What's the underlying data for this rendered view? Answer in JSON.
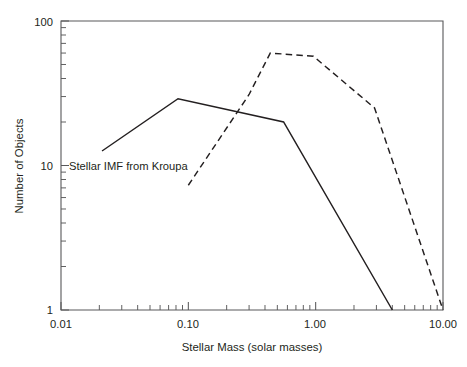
{
  "chart_data": {
    "type": "line",
    "title": "",
    "xlabel": "Stellar Mass (solar masses)",
    "ylabel": "Number of Objects",
    "xscale": "log",
    "yscale": "log",
    "xlim": [
      0.01,
      10.0
    ],
    "ylim": [
      1,
      100
    ],
    "grid": false,
    "legend_position": "none",
    "xticks": [
      0.01,
      0.1,
      1.0,
      10.0
    ],
    "xtick_labels": [
      "0.01",
      "0.10",
      "1.00",
      "10.00"
    ],
    "yticks": [
      1,
      10,
      100
    ],
    "ytick_labels": [
      "1",
      "10",
      "100"
    ],
    "annotations": [
      {
        "text": "Stellar IMF from Kroupa",
        "x": 0.0115,
        "y": 10.2,
        "anchor": "start",
        "target_series": "Stellar IMF from Kroupa"
      }
    ],
    "series": [
      {
        "name": "Stellar IMF from Kroupa",
        "style": "solid",
        "color": "#231f20",
        "x": [
          0.021,
          0.083,
          0.56,
          4.0
        ],
        "y": [
          12.6,
          29.0,
          20.0,
          1.0
        ]
      },
      {
        "name": "Observed distribution",
        "style": "dashed",
        "color": "#231f20",
        "x": [
          0.1,
          0.3,
          0.44,
          0.96,
          2.9,
          10.0
        ],
        "y": [
          7.3,
          31.0,
          60.0,
          57.0,
          25.0,
          1.0
        ]
      }
    ]
  },
  "axes": {
    "x_title": "Stellar Mass (solar masses)",
    "y_title": "Number of Objects"
  }
}
